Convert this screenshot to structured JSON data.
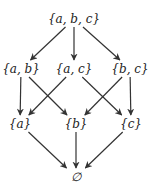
{
  "diagram": {
    "type": "hasse",
    "title": "",
    "nodes": [
      {
        "id": "abc",
        "label": "{a, b, c}",
        "x": 74,
        "y": 19
      },
      {
        "id": "ab",
        "label": "{a, b}",
        "x": 21,
        "y": 69
      },
      {
        "id": "ac",
        "label": "{a, c}",
        "x": 74,
        "y": 69
      },
      {
        "id": "bc",
        "label": "{b, c}",
        "x": 130,
        "y": 69
      },
      {
        "id": "a",
        "label": "{a}",
        "x": 20,
        "y": 124
      },
      {
        "id": "b",
        "label": "{b}",
        "x": 76,
        "y": 124
      },
      {
        "id": "c",
        "label": "{c}",
        "x": 131,
        "y": 124
      },
      {
        "id": "empty",
        "label": "∅",
        "x": 76,
        "y": 177
      }
    ],
    "edges": [
      {
        "from": "abc",
        "to": "ab"
      },
      {
        "from": "abc",
        "to": "ac"
      },
      {
        "from": "abc",
        "to": "bc"
      },
      {
        "from": "ab",
        "to": "a"
      },
      {
        "from": "ab",
        "to": "b"
      },
      {
        "from": "ac",
        "to": "a"
      },
      {
        "from": "ac",
        "to": "c"
      },
      {
        "from": "bc",
        "to": "b"
      },
      {
        "from": "bc",
        "to": "c"
      },
      {
        "from": "a",
        "to": "empty"
      },
      {
        "from": "b",
        "to": "empty"
      },
      {
        "from": "c",
        "to": "empty"
      }
    ],
    "edge_color": "#333333",
    "text_color": "#222222"
  }
}
